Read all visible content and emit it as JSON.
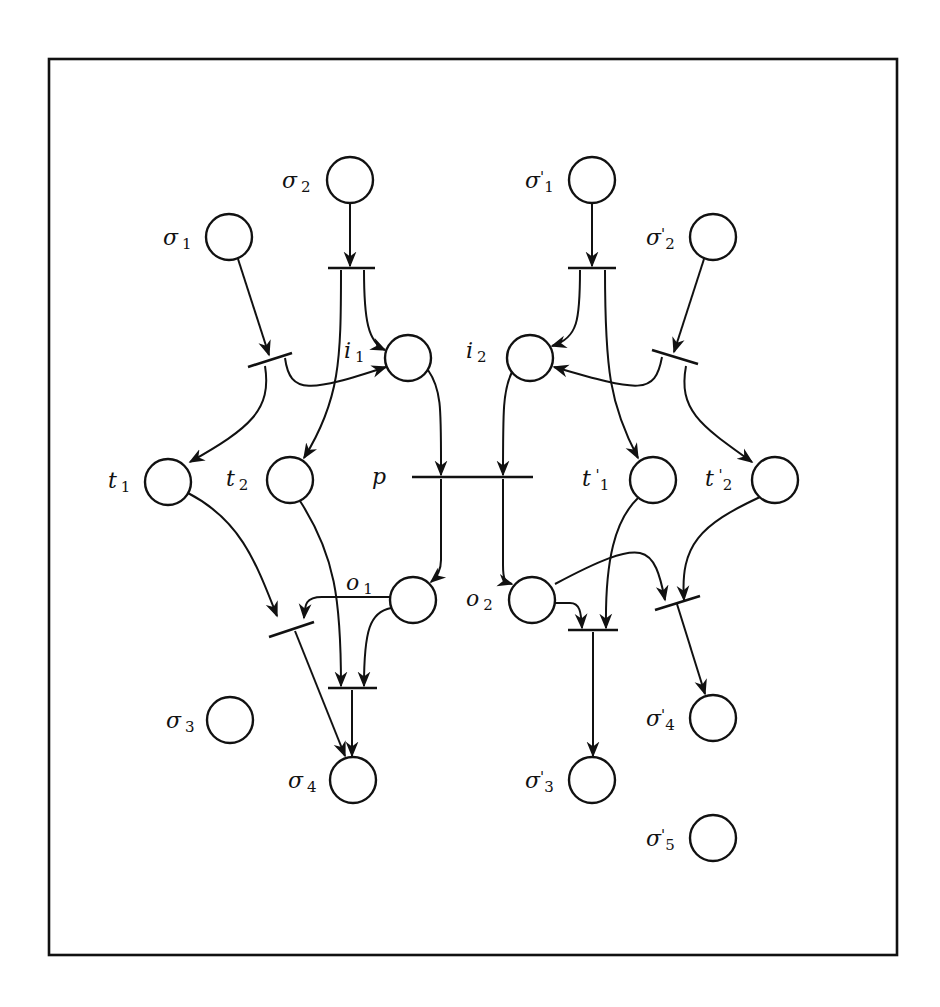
{
  "diagram": {
    "type": "petri-net",
    "frame": {
      "x": 49,
      "y": 59,
      "width": 848,
      "height": 896
    },
    "places": [
      {
        "id": "sigma2",
        "base": "σ",
        "sup": "",
        "sub": "2",
        "cx": 350,
        "cy": 180,
        "lx": 282,
        "ly": 188
      },
      {
        "id": "sigma1",
        "base": "σ",
        "sup": "",
        "sub": "1",
        "cx": 229,
        "cy": 237,
        "lx": 163,
        "ly": 245
      },
      {
        "id": "i1",
        "base": "i",
        "sup": "",
        "sub": "1",
        "cx": 408,
        "cy": 358,
        "lx": 344,
        "ly": 358
      },
      {
        "id": "t1",
        "base": "t",
        "sup": "",
        "sub": "1",
        "cx": 168,
        "cy": 482,
        "lx": 108,
        "ly": 488
      },
      {
        "id": "t2",
        "base": "t",
        "sup": "",
        "sub": "2",
        "cx": 290,
        "cy": 480,
        "lx": 226,
        "ly": 486
      },
      {
        "id": "o1",
        "base": "o",
        "sup": "",
        "sub": "1",
        "cx": 413,
        "cy": 600,
        "lx": 346,
        "ly": 590
      },
      {
        "id": "sigma3",
        "base": "σ",
        "sup": "",
        "sub": "3",
        "cx": 230,
        "cy": 720,
        "lx": 166,
        "ly": 728
      },
      {
        "id": "sigma4",
        "base": "σ",
        "sup": "",
        "sub": "4",
        "cx": 353,
        "cy": 780,
        "lx": 288,
        "ly": 788
      },
      {
        "id": "sigma_p1",
        "base": "σ",
        "sup": "'",
        "sub": "1",
        "cx": 592,
        "cy": 180,
        "lx": 525,
        "ly": 188
      },
      {
        "id": "sigma_p2",
        "base": "σ",
        "sup": "'",
        "sub": "2",
        "cx": 713,
        "cy": 237,
        "lx": 646,
        "ly": 245
      },
      {
        "id": "i2",
        "base": "i",
        "sup": "",
        "sub": "2",
        "cx": 530,
        "cy": 358,
        "lx": 466,
        "ly": 358
      },
      {
        "id": "t_p1",
        "base": "t",
        "sup": " '",
        "sub": "1",
        "cx": 653,
        "cy": 480,
        "lx": 582,
        "ly": 486
      },
      {
        "id": "t_p2",
        "base": "t",
        "sup": " '",
        "sub": "2",
        "cx": 775,
        "cy": 480,
        "lx": 705,
        "ly": 486
      },
      {
        "id": "o2",
        "base": "o",
        "sup": "",
        "sub": "2",
        "cx": 532,
        "cy": 600,
        "lx": 466,
        "ly": 606
      },
      {
        "id": "sigma_p4",
        "base": "σ",
        "sup": "'",
        "sub": "4",
        "cx": 713,
        "cy": 718,
        "lx": 646,
        "ly": 726
      },
      {
        "id": "sigma_p3",
        "base": "σ",
        "sup": "'",
        "sub": "3",
        "cx": 592,
        "cy": 780,
        "lx": 525,
        "ly": 788
      },
      {
        "id": "sigma_p5",
        "base": "σ",
        "sup": "'",
        "sub": "5",
        "cx": 713,
        "cy": 838,
        "lx": 646,
        "ly": 846
      }
    ],
    "transition_labels": [
      {
        "id": "p",
        "text": "p",
        "x": 372,
        "y": 484
      }
    ],
    "place_radius": 23
  }
}
